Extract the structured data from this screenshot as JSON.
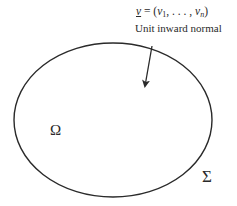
{
  "diagram": {
    "formula": {
      "vector_symbol": "ν",
      "equals": " = (",
      "comp_first_base": "ν",
      "comp_first_sub": "1",
      "separator": ", . . . , ",
      "comp_last_base": "ν",
      "comp_last_sub": "n",
      "close": ")"
    },
    "caption": "Unit inward normal",
    "region_label": "Ω",
    "boundary_label": "Σ",
    "shapes": {
      "boundary_ellipse": {
        "cx": 113,
        "cy": 120,
        "rx": 99,
        "ry": 77
      },
      "normal_arrow": {
        "x1": 152,
        "y1": 46,
        "x2": 145,
        "y2": 86
      }
    },
    "colors": {
      "stroke": "#2a2a2a",
      "background": "#ffffff"
    }
  }
}
